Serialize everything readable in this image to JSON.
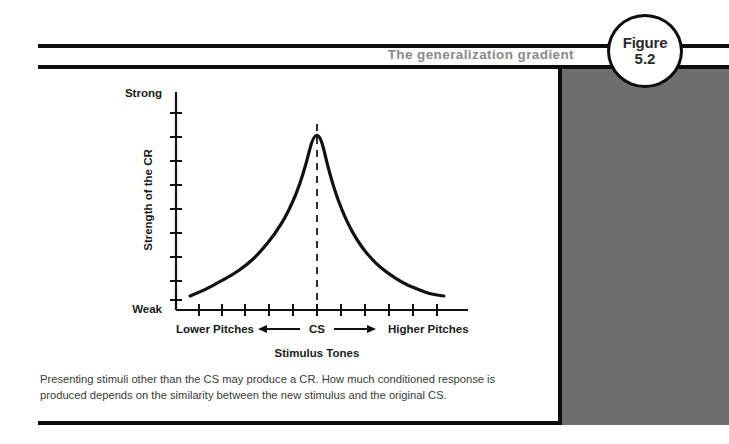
{
  "figure": {
    "title": "The generalization gradient",
    "badge_word": "Figure",
    "badge_number": "5.2",
    "caption": "Presenting stimuli other than the CS may produce a CR. How much conditioned response is produced depends on the similarity between the new stimulus and the original CS."
  },
  "colors": {
    "rule": "#0d0d0d",
    "title_gray": "#8a8a8a",
    "panel_gray": "#6e6e6e",
    "curve": "#111111",
    "caption_text": "#3a3a3a"
  },
  "axis_labels": {
    "y_top": "Strong",
    "y_bottom": "Weak",
    "y_title": "Strength of the CR",
    "x_left": "Lower Pitches",
    "x_center": "CS",
    "x_right": "Higher Pitches",
    "x_title": "Stimulus Tones",
    "left_arrow": "←",
    "right_arrow": "→"
  },
  "chart_data": {
    "type": "line",
    "title": "The generalization gradient",
    "xlabel": "Stimulus Tones",
    "ylabel": "Strength of the CR",
    "xlim": [
      -5,
      5
    ],
    "ylim": [
      0,
      1
    ],
    "ytick_labels": [
      "Weak",
      "Strong"
    ],
    "ytick_count": 9,
    "xtick_count": 11,
    "grid": false,
    "legend": null,
    "annotations": [
      {
        "text": "CS",
        "x": 0,
        "note": "dashed vertical line at the peak"
      },
      {
        "text": "Lower Pitches",
        "x": -4.2
      },
      {
        "text": "Higher Pitches",
        "x": 4.2
      }
    ],
    "series": [
      {
        "name": "Generalization gradient",
        "x": [
          -4.5,
          -4.0,
          -3.5,
          -3.0,
          -2.5,
          -2.0,
          -1.5,
          -1.0,
          -0.5,
          0.0,
          0.5,
          1.0,
          1.5,
          2.0,
          2.5,
          3.0,
          3.5,
          4.0,
          4.5
        ],
        "y": [
          0.06,
          0.09,
          0.13,
          0.17,
          0.22,
          0.29,
          0.38,
          0.5,
          0.68,
          0.97,
          0.66,
          0.46,
          0.33,
          0.24,
          0.18,
          0.13,
          0.1,
          0.07,
          0.06
        ]
      }
    ]
  }
}
